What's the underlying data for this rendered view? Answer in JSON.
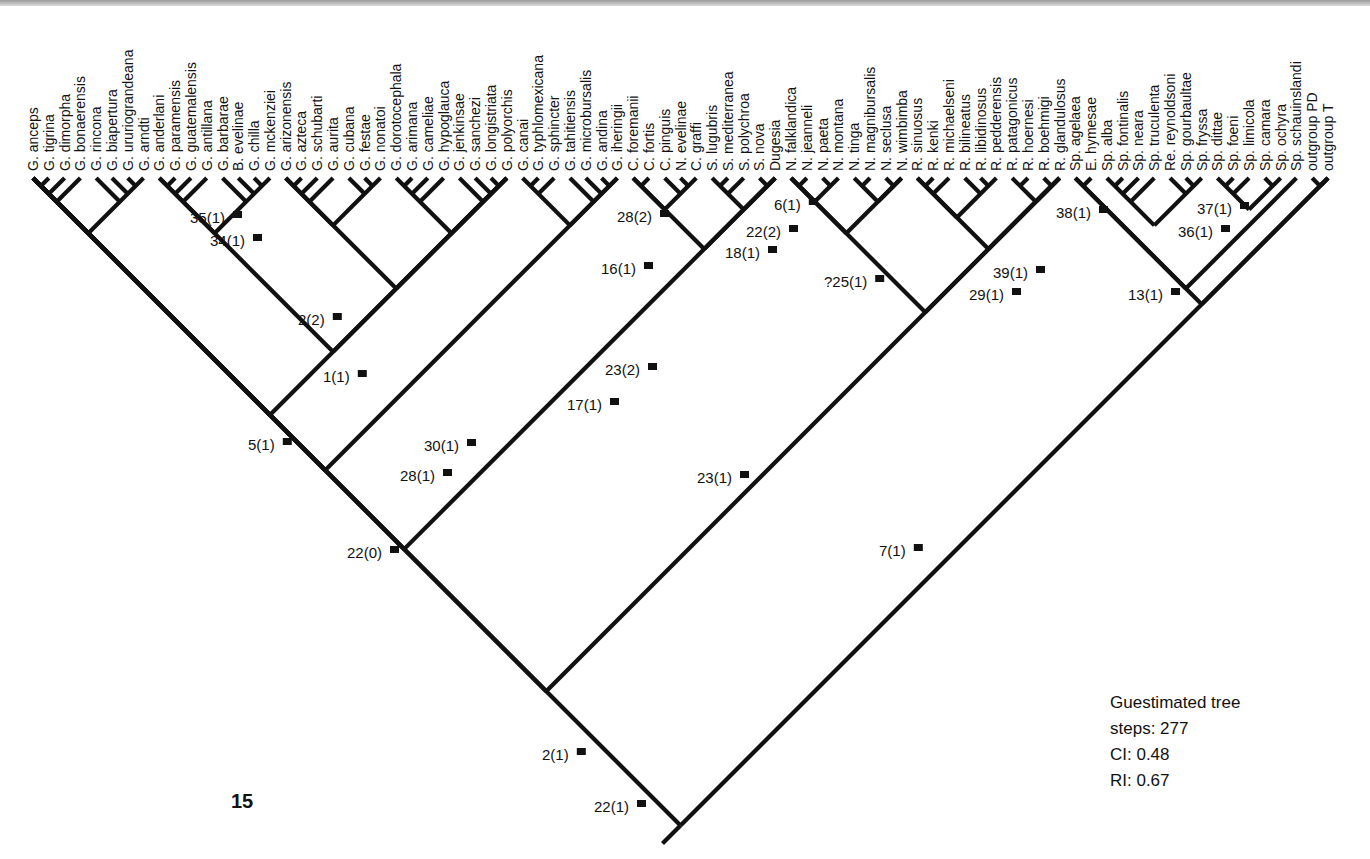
{
  "figure": {
    "number": "15",
    "type": "cladogram"
  },
  "stats": {
    "title": "Guestimated tree",
    "steps": "steps: 277",
    "ci": "CI: 0.48",
    "ri": "RI: 0.67"
  },
  "taxa": [
    "G. anceps",
    "G. tigrina",
    "G. dimorpha",
    "G. bonaerensis",
    "G. rincona",
    "G. biapertura",
    "G. ururiograndeana",
    "G. arndti",
    "G. anderlani",
    "G. paramensis",
    "G. guatemalensis",
    "G. antillana",
    "G. barbarae",
    "B. evelinae",
    "G. chilla",
    "G. mckenziei",
    "G. arizonensis",
    "G. azteca",
    "G. schubarti",
    "G. aurita",
    "G. cubana",
    "G. festae",
    "G. nonatoi",
    "G. dorotocephala",
    "G. arimana",
    "G. cameliae",
    "G. hypoglauca",
    "G. jenkinsae",
    "G. sanchezi",
    "G. longistriata",
    "G. polyorchis",
    "G. canai",
    "G. typhlomexicana",
    "G. sphincter",
    "G. tahitiensis",
    "G. microbursalis",
    "G. andina",
    "G. iheringii",
    "C. foremanii",
    "C. fortis",
    "C. pinguis",
    "N. evelinae",
    "C. graffi",
    "S. lugubris",
    "S. mediterranea",
    "S. polychroa",
    "S. nova",
    "Dugesia",
    "N. falklandica",
    "N. jeanneli",
    "N. paeta",
    "N. montana",
    "N. tinga",
    "N. magnibursalis",
    "N. seclusa",
    "N. wimbimba",
    "R. sinuosus",
    "R. kenki",
    "R. michaelseni",
    "R. bilineatus",
    "R. libidinosus",
    "R. pedderensis",
    "R. patagonicus",
    "R. hoernesi",
    "R. boehmigi",
    "R. glandulosus",
    "Sp. agelaea",
    "E. hymesae",
    "Sp. alba",
    "Sp. fontinalis",
    "Sp. neara",
    "Sp. truculenta",
    "Re. reynoldsoni",
    "Sp. gourbaultae",
    "Sp. fryssa",
    "Sp. dittae",
    "Sp. foeni",
    "Sp. limicola",
    "Sp. camara",
    "Sp. ochyra",
    "Sp. schauinslandi",
    "outgroup PD",
    "outgroup T"
  ],
  "node_labels": [
    {
      "text": "35(1)",
      "x": 190,
      "y": 223
    },
    {
      "text": "34(1)",
      "x": 210,
      "y": 246
    },
    {
      "text": "2(2)",
      "x": 298,
      "y": 325
    },
    {
      "text": "1(1)",
      "x": 323,
      "y": 382
    },
    {
      "text": "5(1)",
      "x": 248,
      "y": 450
    },
    {
      "text": "28(2)",
      "x": 617,
      "y": 222
    },
    {
      "text": "6(1)",
      "x": 774,
      "y": 210
    },
    {
      "text": "22(2)",
      "x": 746,
      "y": 237
    },
    {
      "text": "18(1)",
      "x": 725,
      "y": 258
    },
    {
      "text": "16(1)",
      "x": 601,
      "y": 274
    },
    {
      "text": "?25(1)",
      "x": 824,
      "y": 287
    },
    {
      "text": "39(1)",
      "x": 993,
      "y": 278
    },
    {
      "text": "29(1)",
      "x": 969,
      "y": 300
    },
    {
      "text": "38(1)",
      "x": 1056,
      "y": 218
    },
    {
      "text": "37(1)",
      "x": 1197,
      "y": 214
    },
    {
      "text": "36(1)",
      "x": 1178,
      "y": 237
    },
    {
      "text": "13(1)",
      "x": 1128,
      "y": 300
    },
    {
      "text": "23(2)",
      "x": 605,
      "y": 375
    },
    {
      "text": "17(1)",
      "x": 567,
      "y": 410
    },
    {
      "text": "30(1)",
      "x": 424,
      "y": 451
    },
    {
      "text": "28(1)",
      "x": 400,
      "y": 481
    },
    {
      "text": "23(1)",
      "x": 697,
      "y": 483
    },
    {
      "text": "22(0)",
      "x": 347,
      "y": 558
    },
    {
      "text": "7(1)",
      "x": 879,
      "y": 556
    },
    {
      "text": "2(1)",
      "x": 542,
      "y": 760
    },
    {
      "text": "22(1)",
      "x": 594,
      "y": 812
    }
  ],
  "colors": {
    "ink": "#111111",
    "paper": "#ffffff"
  }
}
